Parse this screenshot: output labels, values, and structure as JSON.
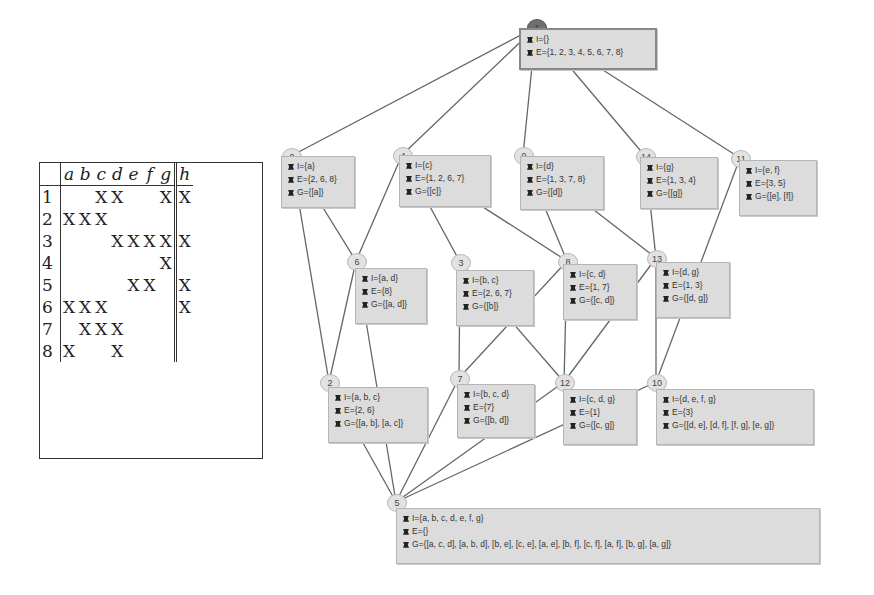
{
  "context_table": {
    "attributes": [
      "a",
      "b",
      "c",
      "d",
      "e",
      "f",
      "g"
    ],
    "target_attribute": "h",
    "rows": [
      {
        "id": "1",
        "cells": [
          "",
          "",
          "X",
          "X",
          "",
          "",
          "X"
        ],
        "target": "X"
      },
      {
        "id": "2",
        "cells": [
          "X",
          "X",
          "X",
          "",
          "",
          "",
          ""
        ],
        "target": ""
      },
      {
        "id": "3",
        "cells": [
          "",
          "",
          "",
          "X",
          "X",
          "X",
          "X"
        ],
        "target": "X"
      },
      {
        "id": "4",
        "cells": [
          "",
          "",
          "",
          "",
          "",
          "",
          "X"
        ],
        "target": ""
      },
      {
        "id": "5",
        "cells": [
          "",
          "",
          "",
          "",
          "X",
          "X",
          ""
        ],
        "target": "X"
      },
      {
        "id": "6",
        "cells": [
          "X",
          "X",
          "X",
          "",
          "",
          "",
          ""
        ],
        "target": "X"
      },
      {
        "id": "7",
        "cells": [
          "",
          "X",
          "X",
          "X",
          "",
          "",
          ""
        ],
        "target": ""
      },
      {
        "id": "8",
        "cells": [
          "X",
          "",
          "",
          "X",
          "",
          "",
          ""
        ],
        "target": ""
      }
    ]
  },
  "lattice": {
    "nodes": [
      {
        "id": "1",
        "label_pos": [
          527,
          19
        ],
        "box": [
          519,
          28,
          138,
          42
        ],
        "root": true,
        "lines": [
          "I={}",
          "E={1, 2, 3, 4, 5, 6, 7, 8}"
        ]
      },
      {
        "id": "0",
        "label_pos": [
          282,
          148
        ],
        "box": [
          281,
          156,
          74,
          52
        ],
        "lines": [
          "I={a}",
          "E={2, 6, 8}",
          "G={[a]}"
        ]
      },
      {
        "id": "4",
        "label_pos": [
          393,
          147
        ],
        "box": [
          399,
          155,
          92,
          52
        ],
        "lines": [
          "I={c}",
          "E={1, 2, 6, 7}",
          "G={[c]}"
        ]
      },
      {
        "id": "9",
        "label_pos": [
          514,
          147
        ],
        "box": [
          520,
          156,
          84,
          54
        ],
        "lines": [
          "I={d}",
          "E={1, 3, 7, 8}",
          "G={[d]}"
        ]
      },
      {
        "id": "14",
        "label_pos": [
          636,
          148
        ],
        "box": [
          640,
          157,
          78,
          52
        ],
        "lines": [
          "I={g}",
          "E={1, 3, 4}",
          "G={[g]}"
        ]
      },
      {
        "id": "11",
        "label_pos": [
          731,
          150
        ],
        "box": [
          739,
          160,
          78,
          56
        ],
        "lines": [
          "I={e, f}",
          "E={3, 5}",
          "G={[e], [f]}"
        ]
      },
      {
        "id": "6",
        "label_pos": [
          347,
          253
        ],
        "box": [
          355,
          268,
          72,
          56
        ],
        "lines": [
          "I={a, d}",
          "E={8}",
          "G={[a, d]}"
        ]
      },
      {
        "id": "3",
        "label_pos": [
          451,
          254
        ],
        "box": [
          456,
          270,
          78,
          56
        ],
        "lines": [
          "I={b, c}",
          "E={2, 6, 7}",
          "G={[b]}"
        ]
      },
      {
        "id": "8",
        "label_pos": [
          558,
          253
        ],
        "box": [
          563,
          264,
          74,
          56
        ],
        "lines": [
          "I={c, d}",
          "E={1, 7}",
          "G={[c, d]}"
        ]
      },
      {
        "id": "13",
        "label_pos": [
          647,
          250
        ],
        "box": [
          656,
          262,
          74,
          56
        ],
        "lines": [
          "I={d, g}",
          "E={1, 3}",
          "G={[d, g]}"
        ]
      },
      {
        "id": "2",
        "label_pos": [
          320,
          374
        ],
        "box": [
          328,
          387,
          100,
          56
        ],
        "lines": [
          "I={a, b, c}",
          "E={2, 6}",
          "G={[a, b], [a, c]}"
        ]
      },
      {
        "id": "7",
        "label_pos": [
          450,
          370
        ],
        "box": [
          457,
          384,
          78,
          54
        ],
        "lines": [
          "I={b, c, d}",
          "E={7}",
          "G={[b, d]}"
        ]
      },
      {
        "id": "12",
        "label_pos": [
          555,
          374
        ],
        "box": [
          563,
          389,
          74,
          56
        ],
        "lines": [
          "I={c, d, g}",
          "E={1}",
          "G={[c, g]}"
        ]
      },
      {
        "id": "10",
        "label_pos": [
          647,
          374
        ],
        "box": [
          656,
          389,
          158,
          56
        ],
        "lines": [
          "I={d, e, f, g}",
          "E={3}",
          "G={[d, e], [d, f], [f, g], [e, g]}"
        ]
      },
      {
        "id": "5",
        "label_pos": [
          387,
          494
        ],
        "box": [
          396,
          508,
          424,
          56
        ],
        "lines": [
          "I={a, b, c, d, e, f, g}",
          "E={}",
          "G={[a, c, d], [a, b, d], [b, e], [c, e], [a, e], [b, f], [c, f], [a, f], [b, g], [a, g]}"
        ]
      }
    ],
    "edges": [
      [
        "1",
        "0"
      ],
      [
        "1",
        "4"
      ],
      [
        "1",
        "9"
      ],
      [
        "1",
        "14"
      ],
      [
        "1",
        "11"
      ],
      [
        "0",
        "6"
      ],
      [
        "0",
        "2"
      ],
      [
        "4",
        "6"
      ],
      [
        "4",
        "3"
      ],
      [
        "4",
        "8"
      ],
      [
        "9",
        "8"
      ],
      [
        "9",
        "13"
      ],
      [
        "14",
        "13"
      ],
      [
        "11",
        "10"
      ],
      [
        "6",
        "5"
      ],
      [
        "6",
        "2"
      ],
      [
        "3",
        "7"
      ],
      [
        "3",
        "12"
      ],
      [
        "8",
        "7"
      ],
      [
        "8",
        "12"
      ],
      [
        "13",
        "12"
      ],
      [
        "13",
        "10"
      ],
      [
        "2",
        "5"
      ],
      [
        "7",
        "5"
      ],
      [
        "12",
        "5"
      ],
      [
        "10",
        "5"
      ]
    ],
    "edge_color": "#666666",
    "box_fill": "#dcdcdc",
    "bullet_icon": "bug-icon"
  }
}
